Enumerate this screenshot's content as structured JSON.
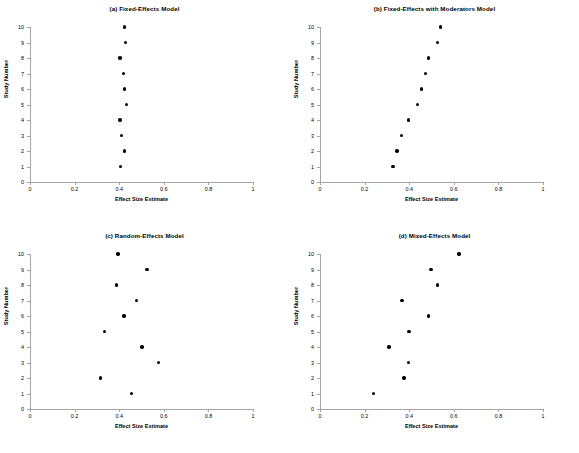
{
  "figure": {
    "name": "meta-analysis-effect-size-panels",
    "background": "#ffffff",
    "axis_color": "#a6a6a6",
    "marker_color": "#000000"
  },
  "axes": {
    "xlabel": "Effect Size Estimate",
    "ylabel": "Study Number",
    "xticks": [
      "0",
      "0.2",
      "0.4",
      "0.6",
      "0.8",
      "1"
    ],
    "xtick_values": [
      0,
      0.2,
      0.4,
      0.6,
      0.8,
      1
    ],
    "yticks": [
      "0",
      "1",
      "2",
      "3",
      "4",
      "5",
      "6",
      "7",
      "8",
      "9",
      "10"
    ],
    "ytick_values": [
      0,
      1,
      2,
      3,
      4,
      5,
      6,
      7,
      8,
      9,
      10
    ],
    "xlim": [
      0,
      1
    ],
    "ylim": [
      0,
      10
    ],
    "grid": false,
    "legend": "none"
  },
  "chart_data": [
    {
      "type": "scatter",
      "panel": "a",
      "title": "(a) Fixed-Effects Model",
      "xlabel": "Effect Size Estimate",
      "ylabel": "Study Number",
      "xlim": [
        0,
        1
      ],
      "ylim": [
        0,
        10
      ],
      "xticks": [
        0,
        0.2,
        0.4,
        0.6,
        0.8,
        1
      ],
      "yticks": [
        0,
        1,
        2,
        3,
        4,
        5,
        6,
        7,
        8,
        9,
        10
      ],
      "grid": false,
      "legend": "none",
      "categories": [
        1,
        2,
        3,
        4,
        5,
        6,
        7,
        8,
        9,
        10
      ],
      "series": [
        {
          "name": "Effect size estimate",
          "x": [
            0.405,
            0.423,
            0.411,
            0.404,
            0.433,
            0.425,
            0.418,
            0.404,
            0.428,
            0.423
          ],
          "y": [
            1,
            2,
            3,
            4,
            5,
            6,
            7,
            8,
            9,
            10
          ]
        }
      ]
    },
    {
      "type": "scatter",
      "panel": "b",
      "title": "(b) Fixed-Effects with Moderators Model",
      "xlabel": "Effect Size Estimate",
      "ylabel": "Study Number",
      "xlim": [
        0,
        1
      ],
      "ylim": [
        0,
        10
      ],
      "xticks": [
        0,
        0.2,
        0.4,
        0.6,
        0.8,
        1
      ],
      "yticks": [
        0,
        1,
        2,
        3,
        4,
        5,
        6,
        7,
        8,
        9,
        10
      ],
      "grid": false,
      "legend": "none",
      "categories": [
        1,
        2,
        3,
        4,
        5,
        6,
        7,
        8,
        9,
        10
      ],
      "series": [
        {
          "name": "Effect size estimate",
          "x": [
            0.327,
            0.345,
            0.365,
            0.398,
            0.437,
            0.455,
            0.472,
            0.486,
            0.527,
            0.541
          ],
          "y": [
            1,
            2,
            3,
            4,
            5,
            6,
            7,
            8,
            9,
            10
          ]
        }
      ]
    },
    {
      "type": "scatter",
      "panel": "c",
      "title": "(c) Random-Effects Model",
      "xlabel": "Effect Size Estimate",
      "ylabel": "Study Number",
      "xlim": [
        0,
        1
      ],
      "ylim": [
        0,
        10
      ],
      "xticks": [
        0,
        0.2,
        0.4,
        0.6,
        0.8,
        1
      ],
      "yticks": [
        0,
        1,
        2,
        3,
        4,
        5,
        6,
        7,
        8,
        9,
        10
      ],
      "grid": false,
      "legend": "none",
      "categories": [
        1,
        2,
        3,
        4,
        5,
        6,
        7,
        8,
        9,
        10
      ],
      "series": [
        {
          "name": "Effect size estimate",
          "x": [
            0.455,
            0.315,
            0.577,
            0.503,
            0.333,
            0.421,
            0.478,
            0.387,
            0.525,
            0.395
          ],
          "y": [
            1,
            2,
            3,
            4,
            5,
            6,
            7,
            8,
            9,
            10
          ]
        }
      ]
    },
    {
      "type": "scatter",
      "panel": "d",
      "title": "(d) Mixed-Effects Model",
      "xlabel": "Effect Size Estimate",
      "ylabel": "Study Number",
      "xlim": [
        0,
        1
      ],
      "ylim": [
        0,
        10
      ],
      "xticks": [
        0,
        0.2,
        0.4,
        0.6,
        0.8,
        1
      ],
      "yticks": [
        0,
        1,
        2,
        3,
        4,
        5,
        6,
        7,
        8,
        9,
        10
      ],
      "grid": false,
      "legend": "none",
      "categories": [
        1,
        2,
        3,
        4,
        5,
        6,
        7,
        8,
        9,
        10
      ],
      "series": [
        {
          "name": "Effect size estimate",
          "x": [
            0.24,
            0.376,
            0.396,
            0.31,
            0.399,
            0.487,
            0.367,
            0.526,
            0.497,
            0.624
          ],
          "y": [
            1,
            2,
            3,
            4,
            5,
            6,
            7,
            8,
            9,
            10
          ]
        }
      ]
    }
  ]
}
